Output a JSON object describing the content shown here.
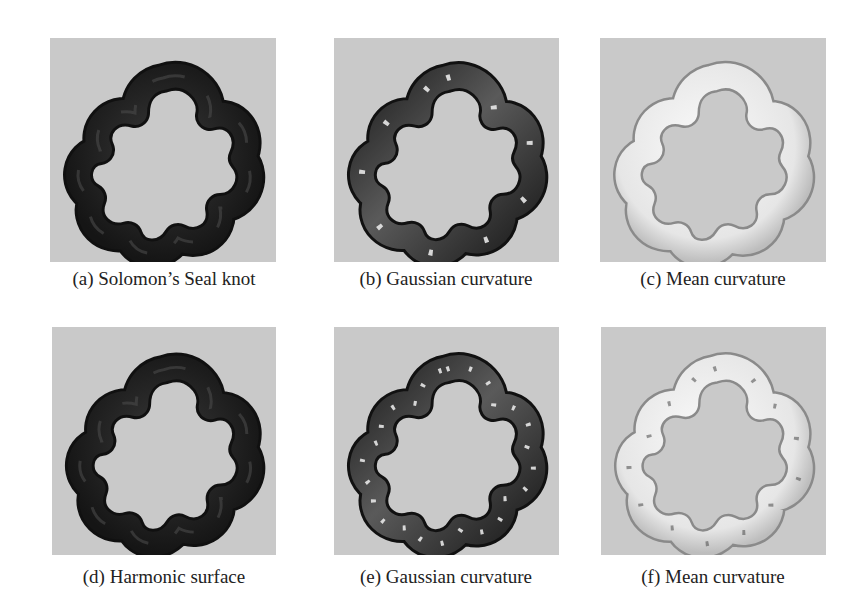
{
  "figure": {
    "panels": [
      {
        "id": "a",
        "caption": "(a) Solomon’s Seal knot",
        "style": "dark-solid",
        "background": "#c9c9c9"
      },
      {
        "id": "b",
        "caption": "(b) Gaussian curvature",
        "style": "dark-gradient",
        "background": "#c9c9c9"
      },
      {
        "id": "c",
        "caption": "(c) Mean curvature",
        "style": "light",
        "background": "#c9c9c9"
      },
      {
        "id": "d",
        "caption": "(d) Harmonic surface",
        "style": "dark-solid",
        "background": "#c9c9c9"
      },
      {
        "id": "e",
        "caption": "(e) Gaussian curvature",
        "style": "dark-gradient",
        "background": "#c9c9c9"
      },
      {
        "id": "f",
        "caption": "(f) Mean curvature",
        "style": "light",
        "background": "#c9c9c9"
      }
    ]
  }
}
